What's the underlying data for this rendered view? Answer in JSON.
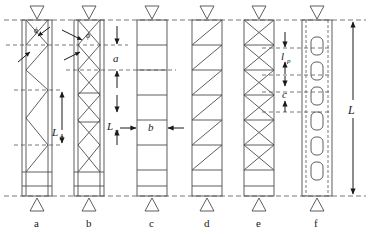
{
  "figure": {
    "type": "engineering-diagram",
    "width": 379,
    "height": 234,
    "background": "#ffffff",
    "line_color": "#4d4d4d",
    "dash_color": "#555555"
  },
  "geometry": {
    "top_line_y": 20,
    "bottom_line_y": 196,
    "column_top_y": 20,
    "column_bottom_y": 196,
    "column_width": 30,
    "column_x": [
      22,
      74,
      137,
      192,
      244,
      302
    ]
  },
  "columns": [
    {
      "id": "a",
      "label": "a",
      "pattern": "single-lacing",
      "description": "single zigzag lacing bars",
      "x": 22,
      "has_end_panel": true,
      "panels": 5,
      "mid_vertical": true
    },
    {
      "id": "b",
      "label": "b",
      "pattern": "double-lacing",
      "description": "double cross lacing bars",
      "x": 74,
      "has_end_panel": true,
      "panels": 7,
      "mid_vertical": true
    },
    {
      "id": "c",
      "label": "c",
      "pattern": "battened",
      "description": "horizontal battens only",
      "x": 137,
      "has_end_panel": true,
      "panels": 7,
      "mid_vertical": false
    },
    {
      "id": "d",
      "label": "d",
      "pattern": "battened-diagonal",
      "description": "battens with single diagonal per panel",
      "x": 192,
      "has_end_panel": true,
      "panels": 7,
      "mid_vertical": false
    },
    {
      "id": "e",
      "label": "e",
      "pattern": "battened-cross",
      "description": "battens with cross diagonals per panel",
      "x": 244,
      "has_end_panel": true,
      "panels": 7,
      "mid_vertical": false
    },
    {
      "id": "f",
      "label": "f",
      "pattern": "perforated",
      "description": "perforated plate with rounded slots",
      "x": 302,
      "has_end_panel": false,
      "slots": 7,
      "mid_vertical": false
    }
  ],
  "annotations": {
    "phi_a": "ϕ",
    "phi_b": "ϕ",
    "dim_a": "a",
    "dim_b": "b",
    "dim_Lp_left": "L",
    "dim_Lp_left_sub": "p",
    "dim_Lp_mid": "L",
    "dim_Lp_mid_sub": "p",
    "dim_lp_right": "l",
    "dim_lp_right_sub": "p",
    "dim_c_right": "c",
    "dim_L_total": "L"
  },
  "supports": {
    "top_marker": "inverted-triangle",
    "bottom_marker": "triangle",
    "count": 6
  }
}
